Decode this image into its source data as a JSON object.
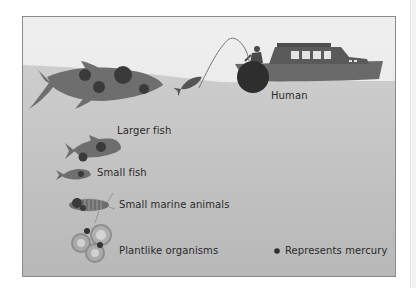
{
  "diagram": {
    "labels": {
      "human": "Human",
      "larger_fish": "Larger fish",
      "small_fish": "Small fish",
      "small_marine_animals": "Small marine animals",
      "plantlike_organisms": "Plantlike organisms"
    },
    "legend": {
      "mercury_label": "Represents mercury",
      "mercury_icon": "filled-dot"
    },
    "colors": {
      "sky_top": "#efefef",
      "sky_bottom": "#e3e3e3",
      "water_top": "#cbcbcb",
      "water_bottom": "#b9b9b9",
      "organism": "#6e6e6e",
      "mercury": "#2e2e2e",
      "frame_border": "#8a8a8a"
    }
  }
}
